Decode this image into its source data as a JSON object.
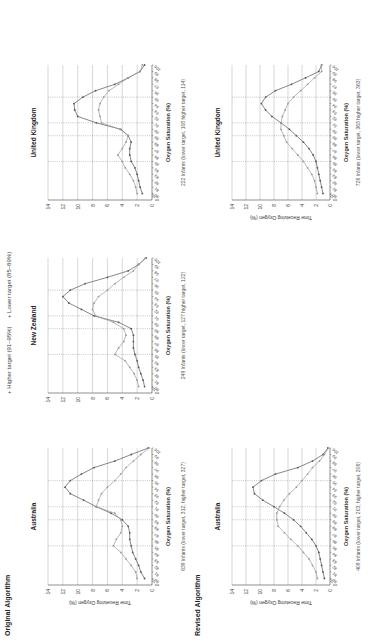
{
  "figure": {
    "sections": [
      {
        "label": "Original Algorithm"
      },
      {
        "label": "Revised Algorithm"
      }
    ],
    "legend": [
      {
        "marker": "+",
        "label": "Higher target (91–95%)",
        "color": "#555555"
      },
      {
        "marker": "+",
        "label": "Lower target (85–89%)",
        "color": "#999999"
      }
    ],
    "colors": {
      "higher": "#555555",
      "lower": "#9a9a9a",
      "grid": "#bdbdbd",
      "dotted": "#888888"
    }
  },
  "chart_data": [
    {
      "type": "line",
      "section": "Original Algorithm",
      "title": "Australia",
      "xlabel": "Oxygen Saturation (%)",
      "ylabel": "Time Receiving Oxygen (%)",
      "caption": "639 Infants (lower target, 312; higher target, 327)",
      "x": [
        80,
        81,
        82,
        83,
        84,
        85,
        86,
        87,
        88,
        89,
        90,
        91,
        92,
        93,
        94,
        95,
        96,
        97,
        98,
        99,
        100
      ],
      "ylim": [
        0,
        14
      ],
      "yticks": [
        0,
        2,
        4,
        6,
        8,
        10,
        12,
        14
      ],
      "reference_lines": [
        85,
        89,
        91,
        95
      ],
      "series": [
        {
          "name": "Higher target (91–95%)",
          "values": [
            1.0,
            1.5,
            1.8,
            2.2,
            2.6,
            2.8,
            3.0,
            3.0,
            3.2,
            4.0,
            5.5,
            7.5,
            9.2,
            11.0,
            11.7,
            11.0,
            9.5,
            7.8,
            5.0,
            2.8,
            0.5
          ]
        },
        {
          "name": "Lower target (85–89%)",
          "values": [
            2.0,
            2.2,
            2.8,
            3.5,
            4.2,
            5.2,
            4.8,
            4.2,
            4.0,
            4.2,
            5.0,
            7.5,
            7.2,
            6.8,
            6.0,
            5.0,
            4.2,
            3.5,
            2.5,
            1.5,
            0.4
          ]
        }
      ]
    },
    {
      "type": "line",
      "section": "Original Algorithm",
      "title": "New Zealand",
      "xlabel": "Oxygen Saturation (%)",
      "ylabel": "",
      "caption": "249 Infants (lower target, 127 higher target, 122)",
      "x": [
        80,
        81,
        82,
        83,
        84,
        85,
        86,
        87,
        88,
        89,
        90,
        91,
        92,
        93,
        94,
        95,
        96,
        97,
        98,
        99,
        100
      ],
      "ylim": [
        0,
        14
      ],
      "yticks": [
        0,
        2,
        4,
        6,
        8,
        10,
        12,
        14
      ],
      "reference_lines": [
        85,
        89,
        91,
        95
      ],
      "series": [
        {
          "name": "Higher target (91–95%)",
          "values": [
            1.0,
            1.2,
            1.5,
            1.8,
            2.0,
            2.3,
            2.5,
            2.5,
            2.5,
            2.8,
            4.5,
            7.8,
            9.5,
            11.2,
            12.0,
            11.0,
            9.0,
            6.0,
            3.2,
            1.8,
            0.8
          ]
        },
        {
          "name": "Lower target (85–89%)",
          "values": [
            1.8,
            2.0,
            2.4,
            3.0,
            3.6,
            5.0,
            4.5,
            3.8,
            3.5,
            3.8,
            5.2,
            7.6,
            8.0,
            7.8,
            7.2,
            6.0,
            5.0,
            3.8,
            2.5,
            1.8,
            0.9
          ]
        }
      ]
    },
    {
      "type": "line",
      "section": "Original Algorithm",
      "title": "United Kingdom",
      "xlabel": "Oxygen Saturation (%)",
      "ylabel": "",
      "caption": "222 Infants (lower target, 108 higher target, 114)",
      "x": [
        80,
        81,
        82,
        83,
        84,
        85,
        86,
        87,
        88,
        89,
        90,
        91,
        92,
        93,
        94,
        95,
        96,
        97,
        98,
        99,
        100
      ],
      "ylim": [
        0,
        14
      ],
      "yticks": [
        0,
        2,
        4,
        6,
        8,
        10,
        12,
        14
      ],
      "reference_lines": [
        85,
        89,
        91,
        95
      ],
      "series": [
        {
          "name": "Higher target (91–95%)",
          "values": [
            1.3,
            1.6,
            1.8,
            2.0,
            2.3,
            2.8,
            3.0,
            3.0,
            2.8,
            3.2,
            4.2,
            7.5,
            10.0,
            10.4,
            10.5,
            9.3,
            7.6,
            5.0,
            3.2,
            1.6,
            1.0
          ]
        },
        {
          "name": "Lower target (85–89%)",
          "values": [
            2.0,
            2.2,
            2.5,
            3.0,
            3.6,
            4.0,
            4.6,
            4.0,
            3.5,
            3.2,
            4.3,
            6.8,
            7.0,
            7.2,
            7.0,
            6.5,
            5.8,
            4.5,
            3.2,
            1.6,
            1.3
          ]
        }
      ]
    },
    {
      "type": "line",
      "section": "Revised Algorithm",
      "title": "Australia",
      "xlabel": "Oxygen Saturation (%)",
      "ylabel": "Time Receiving Oxygen (%)",
      "caption": "409 Infants (lower target, 203; higher target, 206)",
      "x": [
        80,
        81,
        82,
        83,
        84,
        85,
        86,
        87,
        88,
        89,
        90,
        91,
        92,
        93,
        94,
        95,
        96,
        97,
        98,
        99,
        100
      ],
      "ylim": [
        0,
        14
      ],
      "yticks": [
        0,
        2,
        4,
        6,
        8,
        10,
        12,
        14
      ],
      "reference_lines": [
        85,
        89,
        91,
        95
      ],
      "series": [
        {
          "name": "Higher target (91–95%)",
          "values": [
            0.8,
            1.0,
            1.2,
            1.4,
            1.6,
            2.0,
            2.6,
            3.4,
            4.2,
            5.2,
            6.5,
            8.0,
            9.6,
            10.8,
            11.0,
            9.8,
            7.8,
            4.6,
            2.5,
            1.0,
            0.3
          ]
        },
        {
          "name": "Lower target (85–89%)",
          "values": [
            1.8,
            2.0,
            2.5,
            3.0,
            3.8,
            4.6,
            5.6,
            6.5,
            7.4,
            7.6,
            7.6,
            7.2,
            6.6,
            5.8,
            4.8,
            4.0,
            3.2,
            2.5,
            1.5,
            0.8,
            0.2
          ]
        }
      ]
    },
    {
      "type": "line",
      "section": "Revised Algorithm",
      "title": "United Kingdom",
      "xlabel": "Oxygen Saturation (%)",
      "ylabel": "Time Receiving Oxygen (%)",
      "caption": "726 Infants (lower target, 363 higher target, 363)",
      "x": [
        80,
        81,
        82,
        83,
        84,
        85,
        86,
        87,
        88,
        89,
        90,
        91,
        92,
        93,
        94,
        95,
        96,
        97,
        98,
        99,
        100
      ],
      "ylim": [
        0,
        14
      ],
      "yticks": [
        0,
        2,
        4,
        6,
        8,
        10,
        12,
        14
      ],
      "reference_lines": [
        85,
        89,
        91,
        95
      ],
      "series": [
        {
          "name": "Higher target (91–95%)",
          "values": [
            1.0,
            1.2,
            1.4,
            1.6,
            1.8,
            2.0,
            2.4,
            3.0,
            3.8,
            4.8,
            5.8,
            7.0,
            8.3,
            9.2,
            9.8,
            9.2,
            7.8,
            5.5,
            3.5,
            1.6,
            1.2
          ]
        },
        {
          "name": "Lower target (85–89%)",
          "values": [
            1.8,
            2.0,
            2.2,
            2.6,
            3.2,
            3.8,
            4.6,
            5.4,
            6.2,
            6.6,
            7.0,
            7.0,
            6.8,
            6.4,
            6.0,
            5.2,
            4.2,
            3.2,
            2.2,
            1.2,
            1.2
          ]
        }
      ]
    }
  ]
}
